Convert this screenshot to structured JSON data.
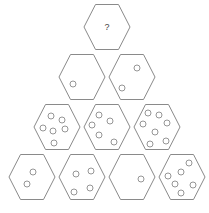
{
  "puzzle": {
    "type": "hexagon-pyramid-dot-count",
    "colors": {
      "outline": "#8a8a8a",
      "background": "#ffffff",
      "text": "#444444"
    },
    "rows": [
      {
        "row": 1,
        "cells": [
          {
            "id": "r1c1",
            "cx": 107,
            "cy": 27,
            "label": "?",
            "dot_count": null,
            "dots": []
          }
        ]
      },
      {
        "row": 2,
        "cells": [
          {
            "id": "r2c1",
            "cx": 82,
            "cy": 77,
            "label": "",
            "dot_count": 1,
            "dots": [
              [
                73,
                84
              ]
            ]
          },
          {
            "id": "r2c2",
            "cx": 132,
            "cy": 77,
            "label": "",
            "dot_count": 2,
            "dots": [
              [
                137,
                68
              ],
              [
                122,
                88
              ]
            ]
          }
        ]
      },
      {
        "row": 3,
        "cells": [
          {
            "id": "r3c1",
            "cx": 57,
            "cy": 127,
            "label": "",
            "dot_count": 6,
            "dots": [
              [
                51,
                116
              ],
              [
                62,
                120
              ],
              [
                43,
                128
              ],
              [
                53,
                131
              ],
              [
                65,
                129
              ],
              [
                54,
                143
              ]
            ]
          },
          {
            "id": "r3c2",
            "cx": 107,
            "cy": 127,
            "label": "",
            "dot_count": 5,
            "dots": [
              [
                99,
                115
              ],
              [
                110,
                121
              ],
              [
                92,
                125
              ],
              [
                99,
                135
              ],
              [
                114,
                142
              ]
            ]
          },
          {
            "id": "r3c3",
            "cx": 157,
            "cy": 127,
            "label": "",
            "dot_count": 7,
            "dots": [
              [
                148,
                113
              ],
              [
                159,
                115
              ],
              [
                167,
                123
              ],
              [
                143,
                124
              ],
              [
                155,
                132
              ],
              [
                166,
                141
              ],
              [
                150,
                144
              ]
            ]
          }
        ]
      },
      {
        "row": 4,
        "cells": [
          {
            "id": "r4c1",
            "cx": 32,
            "cy": 177,
            "label": "",
            "dot_count": 2,
            "dots": [
              [
                33,
                172
              ],
              [
                27,
                184
              ]
            ]
          },
          {
            "id": "r4c2",
            "cx": 82,
            "cy": 177,
            "label": "",
            "dot_count": 4,
            "dots": [
              [
                91,
                171
              ],
              [
                76,
                174
              ],
              [
                90,
                188
              ],
              [
                74,
                192
              ]
            ]
          },
          {
            "id": "r4c3",
            "cx": 132,
            "cy": 177,
            "label": "",
            "dot_count": 1,
            "dots": [
              [
                141,
                179
              ]
            ]
          },
          {
            "id": "r4c4",
            "cx": 182,
            "cy": 177,
            "label": "",
            "dot_count": 6,
            "dots": [
              [
                189,
                163
              ],
              [
                181,
                172
              ],
              [
                168,
                176
              ],
              [
                175,
                184
              ],
              [
                193,
                185
              ],
              [
                181,
                193
              ]
            ]
          }
        ]
      }
    ]
  }
}
